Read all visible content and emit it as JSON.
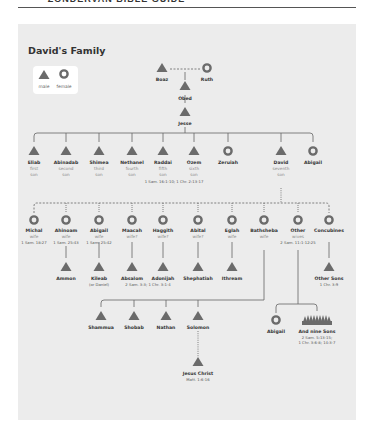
{
  "header": {
    "running_title": "• ZONDERVAN BIBLE GUIDE"
  },
  "diagram": {
    "title": "David's Family",
    "colors": {
      "panel": "#ececec",
      "node": "#6b6b6b",
      "line": "#666666",
      "text": "#333333",
      "subtext": "#8a8a8a"
    },
    "legend": {
      "male": "male",
      "female": "female"
    },
    "ancestors": {
      "boaz": {
        "name": "Boaz",
        "icon": "male-triangle-icon"
      },
      "ruth": {
        "name": "Ruth",
        "icon": "female-circle-icon"
      },
      "obed": {
        "name": "Obed",
        "icon": "male-triangle-icon"
      },
      "jesse": {
        "name": "Jesse",
        "icon": "male-triangle-icon"
      }
    },
    "jesse_children": [
      {
        "name": "Eliab",
        "role1": "first",
        "role2": "son",
        "icon": "male-triangle-icon"
      },
      {
        "name": "Abinadab",
        "role1": "second",
        "role2": "son",
        "icon": "male-triangle-icon"
      },
      {
        "name": "Shimea",
        "role1": "third",
        "role2": "son",
        "icon": "male-triangle-icon"
      },
      {
        "name": "Nethanel",
        "role1": "fourth",
        "role2": "son",
        "icon": "male-triangle-icon"
      },
      {
        "name": "Raddai",
        "role1": "fifth",
        "role2": "son",
        "icon": "male-triangle-icon"
      },
      {
        "name": "Ozem",
        "role1": "sixth",
        "role2": "son",
        "icon": "male-triangle-icon"
      },
      {
        "name": "Zeruiah",
        "role1": "",
        "role2": "",
        "icon": "female-circle-icon"
      },
      {
        "name": "David",
        "role1": "seventh",
        "role2": "son",
        "icon": "male-triangle-icon"
      },
      {
        "name": "Abigail",
        "role1": "",
        "role2": "",
        "icon": "female-circle-icon"
      }
    ],
    "jesse_children_ref": "1 Sam. 16:1-10; 1 Chr. 2:13-17",
    "wives": [
      {
        "name": "Michal",
        "role": "wife",
        "ref": "1 Sam. 18:27"
      },
      {
        "name": "Ahinoam",
        "role": "wife",
        "ref": "1 Sam. 25:43"
      },
      {
        "name": "Abigail",
        "role": "wife",
        "ref": "1 Sam. 25:42"
      },
      {
        "name": "Maacah",
        "role": "wife?",
        "ref": ""
      },
      {
        "name": "Haggith",
        "role": "wife?",
        "ref": ""
      },
      {
        "name": "Abital",
        "role": "wife?",
        "ref": ""
      },
      {
        "name": "Eglah",
        "role": "wife",
        "ref": ""
      },
      {
        "name": "Bathsheba",
        "role": "wife",
        "ref": ""
      },
      {
        "name": "Other",
        "role": "wives",
        "ref": "2 Sam. 11:1-12:25"
      },
      {
        "name": "Concubines",
        "role": "",
        "ref": ""
      }
    ],
    "sons_row": [
      {
        "name": "Ammon",
        "note": ""
      },
      {
        "name": "Kileab",
        "note": "(or Daniel)"
      },
      {
        "name": "Absalom",
        "note": ""
      },
      {
        "name": "Adonijah",
        "note": ""
      },
      {
        "name": "Shephatiah",
        "note": ""
      },
      {
        "name": "Ithream",
        "note": ""
      },
      {
        "name": "Other Sons",
        "note": "1 Chr. 3:9"
      }
    ],
    "absalom_adonijah_ref": "2 Sam. 3:3; 1 Chr. 3:1-4",
    "bathsheba_sons": [
      {
        "name": "Shammua"
      },
      {
        "name": "Shobab"
      },
      {
        "name": "Nathan"
      },
      {
        "name": "Solomon"
      }
    ],
    "other_wives_children": [
      {
        "name": "Abigail",
        "icon": "female-circle-icon"
      },
      {
        "name": "And nine Sons",
        "icon": "many-males-icon",
        "ref1": "2 Sam. 5:13-15;",
        "ref2": "1 Chr. 3:6-8; 14:3-7"
      }
    ],
    "descendant": {
      "name": "Jesus Christ",
      "ref": "Matt. 1:6-16"
    }
  }
}
